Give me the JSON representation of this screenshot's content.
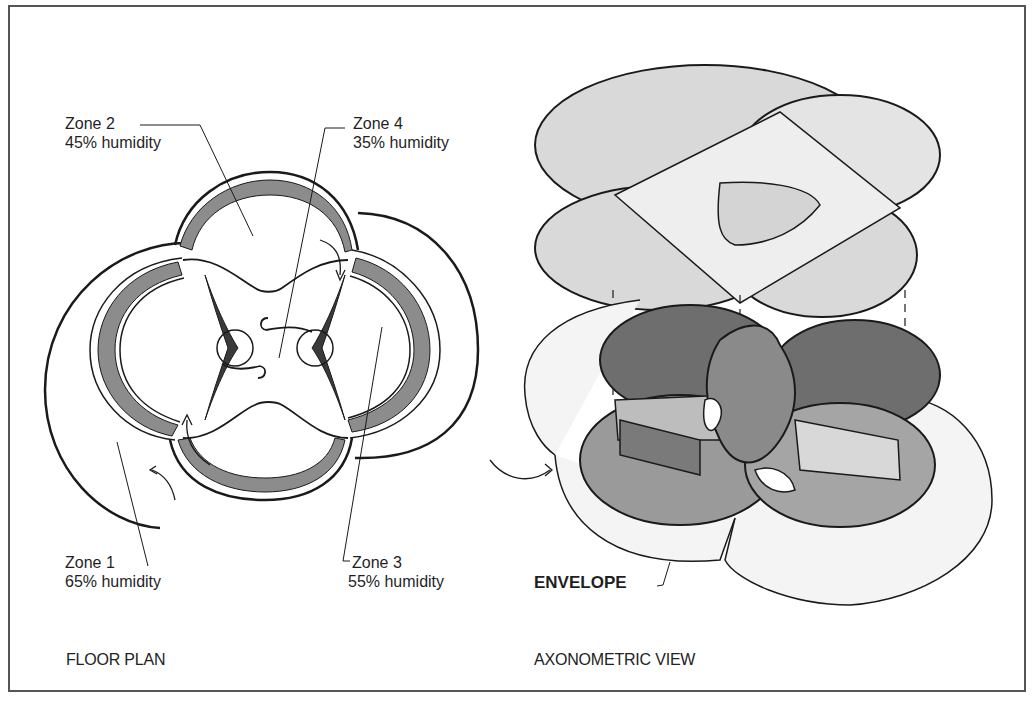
{
  "figure": {
    "panels": [
      {
        "id": "floor_plan",
        "caption": "FLOOR PLAN",
        "zones": [
          {
            "name": "Zone 1",
            "humidity": "65% humidity"
          },
          {
            "name": "Zone 2",
            "humidity": "45% humidity"
          },
          {
            "name": "Zone 3",
            "humidity": "55% humidity"
          },
          {
            "name": "Zone 4",
            "humidity": "35% humidity"
          }
        ]
      },
      {
        "id": "axonometric_view",
        "caption": "AXONOMETRIC VIEW",
        "callouts": [
          {
            "label": "ENVELOPE"
          }
        ]
      }
    ],
    "colors": {
      "line": "#1a1a1a",
      "wall_mid": "#8c8c8c",
      "wall_dark": "#4a4a4a",
      "roof_fill": "#d9d9d9",
      "roof_light": "#ececec",
      "floor_dark": "#6e6e6e",
      "floor_mid": "#9a9a9a",
      "floor_light": "#bdbdbd",
      "envelope_fill": "#f4f4f4"
    }
  }
}
